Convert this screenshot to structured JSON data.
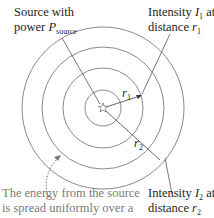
{
  "diagram": {
    "source_label": {
      "line1": "Source with",
      "line2_prefix": "power ",
      "symbol": "P",
      "subscript": "source"
    },
    "intensity1_label": {
      "line1_prefix": "Intensity ",
      "symbol": "I",
      "subscript": "1",
      "line1_suffix": " at",
      "line2_prefix": "distance ",
      "r_symbol": "r",
      "r_subscript": "1"
    },
    "intensity2_label": {
      "line1_prefix": "Intensity ",
      "symbol": "I",
      "subscript": "2",
      "line1_suffix": " at",
      "line2_prefix": "distance ",
      "r_symbol": "r",
      "r_subscript": "2"
    },
    "radius1_label": {
      "symbol": "r",
      "subscript": "1"
    },
    "radius2_label": {
      "symbol": "r",
      "subscript": "2"
    },
    "caption": {
      "line1": "The energy from the source",
      "line2": "is spread uniformly over a"
    },
    "colors": {
      "circle": "#8a8a8a",
      "line": "#555555",
      "caption": "#7a7a7a",
      "text": "#231f20"
    }
  }
}
